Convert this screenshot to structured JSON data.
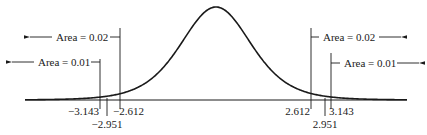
{
  "chart_data": {
    "type": "line",
    "title": "",
    "curve": "symmetric bell-shaped (t) density centered at 0",
    "xlabel": "",
    "ylabel": "",
    "grid": false,
    "critical_values": [
      {
        "value": -3.143,
        "label": "−3.143",
        "tail": "left",
        "area": 0.01
      },
      {
        "value": -2.951,
        "label": "−2.951",
        "tail": "left",
        "area": null
      },
      {
        "value": -2.612,
        "label": "−2.612",
        "tail": "left",
        "area": 0.02
      },
      {
        "value": 2.612,
        "label": "2.612",
        "tail": "right",
        "area": 0.02
      },
      {
        "value": 2.951,
        "label": "2.951",
        "tail": "right",
        "area": null
      },
      {
        "value": 3.143,
        "label": "3.143",
        "tail": "right",
        "area": 0.01
      }
    ],
    "annotations": [
      {
        "text": "Area = 0.02",
        "side": "left",
        "arrow": "left"
      },
      {
        "text": "Area = 0.01",
        "side": "left",
        "arrow": "left"
      },
      {
        "text": "Area = 0.02",
        "side": "right",
        "arrow": "right"
      },
      {
        "text": "Area = 0.01",
        "side": "right",
        "arrow": "right"
      }
    ]
  },
  "labels": {
    "left_area_002": "Area = 0.02",
    "left_area_001": "Area = 0.01",
    "right_area_002": "Area = 0.02",
    "right_area_001": "Area = 0.01",
    "tick_neg_3143": "−3.143",
    "tick_neg_2951": "−2.951",
    "tick_neg_2612": "−2.612",
    "tick_pos_2612": "2.612",
    "tick_pos_2951": "2.951",
    "tick_pos_3143": "3.143"
  },
  "colors": {
    "line": "#1a1a1a",
    "background": "#ffffff"
  }
}
